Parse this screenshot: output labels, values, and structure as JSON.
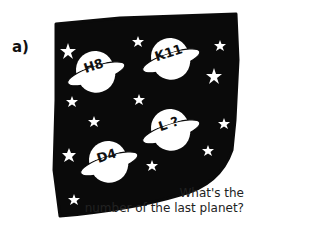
{
  "problem_label": "a)",
  "planets": [
    {
      "label": "H8",
      "cx": 95,
      "cy": 70
    },
    {
      "label": "K11",
      "cx": 170,
      "cy": 57
    },
    {
      "label": "L ?",
      "cx": 170,
      "cy": 128
    },
    {
      "label": "D4",
      "cx": 108,
      "cy": 160
    }
  ],
  "caption": {
    "line1": "What's the",
    "line2": "number of the last planet?"
  },
  "colors": {
    "sky": "#0a0a0a",
    "planet": "#ffffff",
    "star": "#ffffff"
  }
}
